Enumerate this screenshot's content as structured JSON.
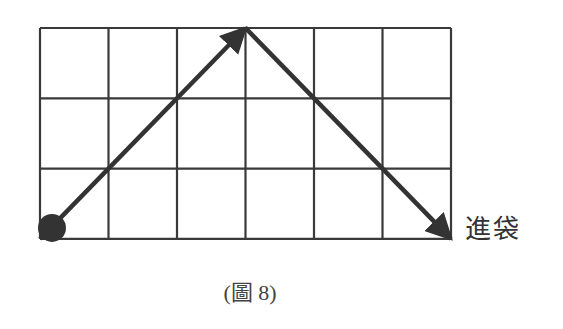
{
  "diagram": {
    "grid": {
      "cols": 6,
      "rows": 3,
      "left": 40,
      "top": 28,
      "cell_w": 68.5,
      "cell_h": 70.3,
      "line_color": "#3a3a3a"
    },
    "path": {
      "color": "#333333",
      "start_point": {
        "col": 0,
        "row": 0,
        "marker": "filled-circle"
      },
      "segments": [
        {
          "from": [
            0,
            0
          ],
          "to": [
            3,
            3
          ],
          "arrowhead": true
        },
        {
          "from": [
            3,
            3
          ],
          "to": [
            6,
            0
          ],
          "arrowhead": true
        }
      ]
    },
    "end_label": "進袋"
  },
  "caption": "(圖 8)"
}
